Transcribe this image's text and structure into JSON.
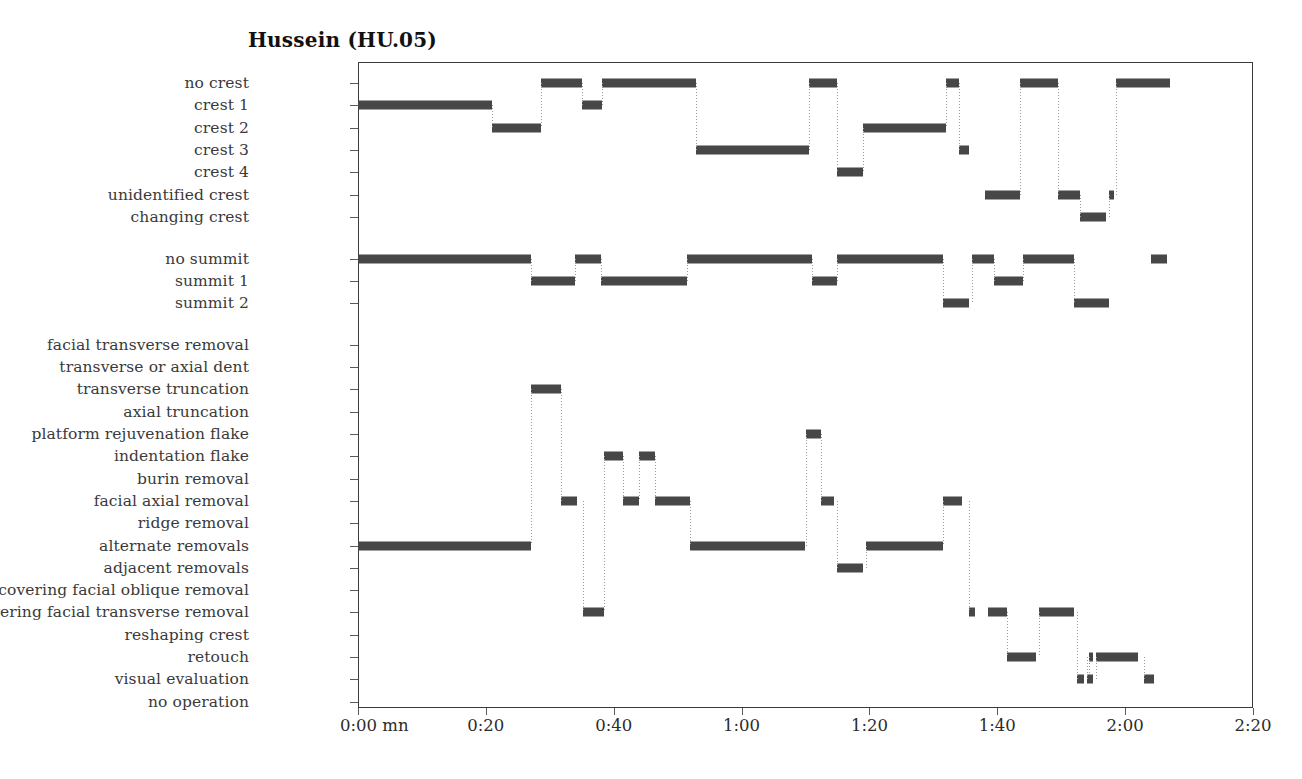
{
  "title": "Hussein (HU.05)",
  "colors": {
    "bar": "#474747",
    "connector": "#9a9a9a",
    "frame": "#3b3b3b",
    "text": "#3a3a3a"
  },
  "axis": {
    "x_ticks": [
      "0:00 mn",
      "0:20",
      "0:40",
      "1:00",
      "1:20",
      "1:40",
      "2:00",
      "2:20"
    ],
    "x_tick_minutes": [
      0,
      20,
      40,
      60,
      80,
      100,
      120,
      140
    ],
    "x_min": 0,
    "x_max": 140,
    "x_unit": "mn"
  },
  "groups": [
    {
      "name": "crest",
      "rows": [
        "no crest",
        "crest 1",
        "crest 2",
        "crest 3",
        "crest 4",
        "unidentified crest",
        "changing crest"
      ]
    },
    {
      "name": "summit",
      "rows": [
        "no summit",
        "summit 1",
        "summit 2"
      ]
    },
    {
      "name": "operation",
      "rows": [
        "facial transverse removal",
        "transverse or axial dent",
        "transverse truncation",
        "axial truncation",
        "platform rejuvenation flake",
        "indentation flake",
        "burin removal",
        "facial axial removal",
        "ridge removal",
        "alternate removals",
        "adjacent removals",
        "covering facial oblique removal",
        "covering facial transverse removal",
        "reshaping crest",
        "retouch",
        "visual evaluation",
        "no operation"
      ]
    }
  ],
  "chart_data": {
    "type": "line",
    "title": "Hussein (HU.05)",
    "xlabel": "0:00 mn",
    "ylabel": "",
    "xlim": [
      0,
      140
    ],
    "grid": false,
    "legend": "none",
    "series": [
      {
        "name": "crest",
        "categories": [
          "no crest",
          "crest 1",
          "crest 2",
          "crest 3",
          "crest 4",
          "unidentified crest",
          "changing crest"
        ],
        "segments": [
          {
            "row": "crest 1",
            "start": 0.0,
            "end": 21.0
          },
          {
            "row": "crest 2",
            "start": 21.0,
            "end": 28.6
          },
          {
            "row": "no crest",
            "start": 28.6,
            "end": 35.0
          },
          {
            "row": "crest 1",
            "start": 35.0,
            "end": 38.2
          },
          {
            "row": "no crest",
            "start": 38.2,
            "end": 52.8
          },
          {
            "row": "crest 3",
            "start": 52.8,
            "end": 70.5
          },
          {
            "row": "no crest",
            "start": 70.5,
            "end": 75.0
          },
          {
            "row": "crest 4",
            "start": 75.0,
            "end": 79.0
          },
          {
            "row": "crest 2",
            "start": 79.0,
            "end": 92.0
          },
          {
            "row": "no crest",
            "start": 92.0,
            "end": 94.0
          },
          {
            "row": "crest 3",
            "start": 94.0,
            "end": 95.5
          },
          {
            "row": "unidentified crest",
            "start": 98.0,
            "end": 103.5
          },
          {
            "row": "no crest",
            "start": 103.5,
            "end": 109.5
          },
          {
            "row": "unidentified crest",
            "start": 109.5,
            "end": 113.0
          },
          {
            "row": "changing crest",
            "start": 113.0,
            "end": 117.0
          },
          {
            "row": "unidentified crest",
            "start": 117.5,
            "end": 118.3
          },
          {
            "row": "no crest",
            "start": 118.5,
            "end": 127.0
          }
        ]
      },
      {
        "name": "summit",
        "categories": [
          "no summit",
          "summit 1",
          "summit 2"
        ],
        "segments": [
          {
            "row": "no summit",
            "start": 0.0,
            "end": 27.0
          },
          {
            "row": "summit 1",
            "start": 27.0,
            "end": 34.0
          },
          {
            "row": "no summit",
            "start": 34.0,
            "end": 38.0
          },
          {
            "row": "summit 1",
            "start": 38.0,
            "end": 51.5
          },
          {
            "row": "no summit",
            "start": 51.5,
            "end": 71.0
          },
          {
            "row": "summit 1",
            "start": 71.0,
            "end": 75.0
          },
          {
            "row": "no summit",
            "start": 75.0,
            "end": 91.5
          },
          {
            "row": "summit 2",
            "start": 91.5,
            "end": 95.5
          },
          {
            "row": "no summit",
            "start": 96.0,
            "end": 99.5
          },
          {
            "row": "summit 1",
            "start": 99.5,
            "end": 104.0
          },
          {
            "row": "no summit",
            "start": 104.0,
            "end": 112.0
          },
          {
            "row": "summit 2",
            "start": 112.0,
            "end": 117.5
          },
          {
            "row": "no summit",
            "start": 124.0,
            "end": 126.5
          }
        ]
      },
      {
        "name": "operation",
        "categories": [
          "facial transverse removal",
          "transverse or axial dent",
          "transverse truncation",
          "axial truncation",
          "platform rejuvenation flake",
          "indentation flake",
          "burin removal",
          "facial axial removal",
          "ridge removal",
          "alternate removals",
          "adjacent removals",
          "covering facial oblique removal",
          "covering facial transverse removal",
          "reshaping crest",
          "retouch",
          "visual evaluation",
          "no operation"
        ],
        "segments": [
          {
            "row": "alternate removals",
            "start": 0.0,
            "end": 27.0
          },
          {
            "row": "transverse truncation",
            "start": 27.0,
            "end": 31.8
          },
          {
            "row": "facial axial removal",
            "start": 31.8,
            "end": 34.2
          },
          {
            "row": "covering facial transverse removal",
            "start": 35.2,
            "end": 38.5
          },
          {
            "row": "indentation flake",
            "start": 38.5,
            "end": 41.5
          },
          {
            "row": "facial axial removal",
            "start": 41.5,
            "end": 44.0
          },
          {
            "row": "indentation flake",
            "start": 44.0,
            "end": 46.5
          },
          {
            "row": "facial axial removal",
            "start": 46.5,
            "end": 52.0
          },
          {
            "row": "alternate removals",
            "start": 52.0,
            "end": 70.0
          },
          {
            "row": "platform rejuvenation flake",
            "start": 70.0,
            "end": 72.5
          },
          {
            "row": "facial axial removal",
            "start": 72.5,
            "end": 74.5
          },
          {
            "row": "adjacent removals",
            "start": 75.0,
            "end": 79.0
          },
          {
            "row": "alternate removals",
            "start": 79.5,
            "end": 91.5
          },
          {
            "row": "facial axial removal",
            "start": 91.5,
            "end": 94.5
          },
          {
            "row": "covering facial transverse removal",
            "start": 95.5,
            "end": 96.5
          },
          {
            "row": "covering facial transverse removal",
            "start": 98.5,
            "end": 101.5
          },
          {
            "row": "retouch",
            "start": 101.5,
            "end": 106.0
          },
          {
            "row": "covering facial transverse removal",
            "start": 106.5,
            "end": 112.0
          },
          {
            "row": "visual evaluation",
            "start": 112.5,
            "end": 113.6
          },
          {
            "row": "retouch",
            "start": 114.3,
            "end": 115.0
          },
          {
            "row": "visual evaluation",
            "start": 114.0,
            "end": 115.0
          },
          {
            "row": "retouch",
            "start": 115.5,
            "end": 122.0
          },
          {
            "row": "visual evaluation",
            "start": 123.0,
            "end": 124.5
          }
        ]
      }
    ]
  }
}
